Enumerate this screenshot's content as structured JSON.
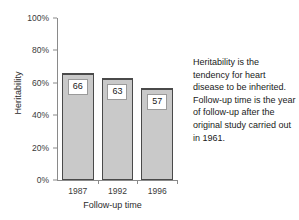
{
  "chart_data": {
    "type": "bar",
    "title": "",
    "categories": [
      "1987",
      "1992",
      "1996"
    ],
    "values": [
      66,
      63,
      57
    ],
    "value_labels": [
      "66",
      "63",
      "57"
    ],
    "xlabel": "Follow-up time",
    "ylabel": "Heritability",
    "ylim": [
      0,
      100
    ],
    "yticks": [
      0,
      20,
      40,
      60,
      80,
      100
    ],
    "ytick_labels": [
      "0%",
      "20%",
      "40%",
      "60%",
      "80%",
      "100%"
    ],
    "grid": false,
    "legend": null,
    "units": "percent",
    "bar_fill_color": "#c9c9c9",
    "bar_border_color": "#4a4a4a",
    "axis_color": "#8a8a8a",
    "background_color": "#ffffff",
    "annotation": "Heritability is the tendency for heart disease to be inherited. Follow-up time is the year of follow-up after the original study carried out in 1961."
  }
}
